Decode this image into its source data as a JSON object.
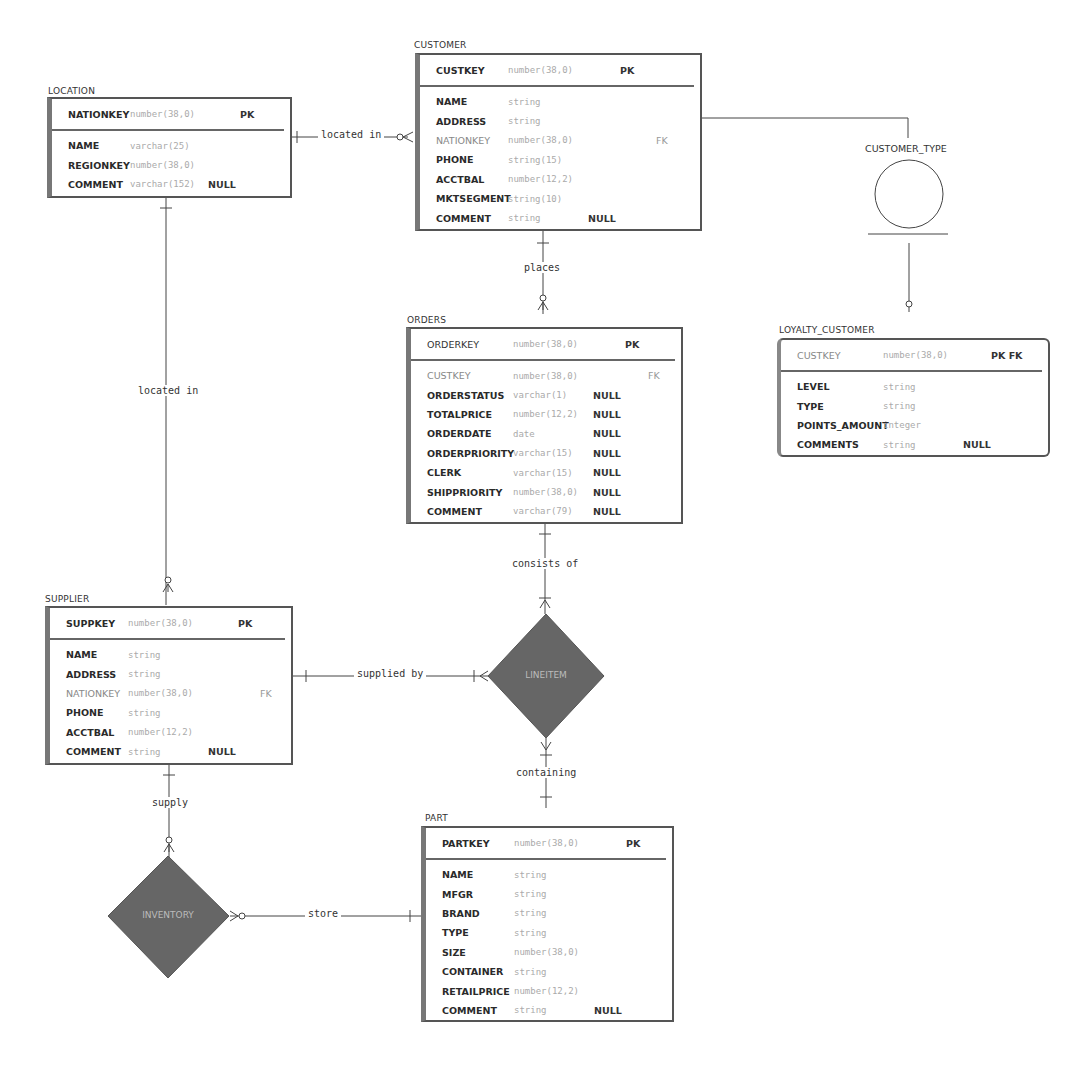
{
  "colors": {
    "entity_border": "#555555",
    "entity_left_bar": "#777777",
    "diamond_fill": "#666666",
    "line": "#444444",
    "type_text": "#aaaaaa"
  },
  "entities": {
    "location": {
      "title": "LOCATION",
      "pk": {
        "name": "NATIONKEY",
        "type": "number(38,0)",
        "key": "PK"
      },
      "attrs": [
        {
          "name": "NAME",
          "type": "varchar(25)",
          "null": "",
          "key": ""
        },
        {
          "name": "REGIONKEY",
          "type": "number(38,0)",
          "null": "",
          "key": ""
        },
        {
          "name": "COMMENT",
          "type": "varchar(152)",
          "null": "NULL",
          "key": ""
        }
      ]
    },
    "customer": {
      "title": "CUSTOMER",
      "pk": {
        "name": "CUSTKEY",
        "type": "number(38,0)",
        "key": "PK"
      },
      "attrs": [
        {
          "name": "NAME",
          "type": "string",
          "null": "",
          "key": ""
        },
        {
          "name": "ADDRESS",
          "type": "string",
          "null": "",
          "key": ""
        },
        {
          "name": "NATIONKEY",
          "type": "number(38,0)",
          "null": "",
          "key": "FK"
        },
        {
          "name": "PHONE",
          "type": "string(15)",
          "null": "",
          "key": ""
        },
        {
          "name": "ACCTBAL",
          "type": "number(12,2)",
          "null": "",
          "key": ""
        },
        {
          "name": "MKTSEGMENT",
          "type": "string(10)",
          "null": "",
          "key": ""
        },
        {
          "name": "COMMENT",
          "type": "string",
          "null": "NULL",
          "key": ""
        }
      ]
    },
    "orders": {
      "title": "ORDERS",
      "pk": {
        "name": "ORDERKEY",
        "type": "number(38,0)",
        "key": "PK"
      },
      "attrs": [
        {
          "name": "CUSTKEY",
          "type": "number(38,0)",
          "null": "",
          "key": "FK"
        },
        {
          "name": "ORDERSTATUS",
          "type": "varchar(1)",
          "null": "NULL",
          "key": ""
        },
        {
          "name": "TOTALPRICE",
          "type": "number(12,2)",
          "null": "NULL",
          "key": ""
        },
        {
          "name": "ORDERDATE",
          "type": "date",
          "null": "NULL",
          "key": ""
        },
        {
          "name": "ORDERPRIORITY",
          "type": "varchar(15)",
          "null": "NULL",
          "key": ""
        },
        {
          "name": "CLERK",
          "type": "varchar(15)",
          "null": "NULL",
          "key": ""
        },
        {
          "name": "SHIPPRIORITY",
          "type": "number(38,0)",
          "null": "NULL",
          "key": ""
        },
        {
          "name": "COMMENT",
          "type": "varchar(79)",
          "null": "NULL",
          "key": ""
        }
      ]
    },
    "loyalty_customer": {
      "title": "LOYALTY_CUSTOMER",
      "pk": {
        "name": "CUSTKEY",
        "type": "number(38,0)",
        "key": "PK FK"
      },
      "attrs": [
        {
          "name": "LEVEL",
          "type": "string",
          "null": "",
          "key": ""
        },
        {
          "name": "TYPE",
          "type": "string",
          "null": "",
          "key": ""
        },
        {
          "name": "POINTS_AMOUNT",
          "type": "integer",
          "null": "",
          "key": ""
        },
        {
          "name": "COMMENTS",
          "type": "string",
          "null": "NULL",
          "key": ""
        }
      ]
    },
    "supplier": {
      "title": "SUPPLIER",
      "pk": {
        "name": "SUPPKEY",
        "type": "number(38,0)",
        "key": "PK"
      },
      "attrs": [
        {
          "name": "NAME",
          "type": "string",
          "null": "",
          "key": ""
        },
        {
          "name": "ADDRESS",
          "type": "string",
          "null": "",
          "key": ""
        },
        {
          "name": "NATIONKEY",
          "type": "number(38,0)",
          "null": "",
          "key": "FK"
        },
        {
          "name": "PHONE",
          "type": "string",
          "null": "",
          "key": ""
        },
        {
          "name": "ACCTBAL",
          "type": "number(12,2)",
          "null": "",
          "key": ""
        },
        {
          "name": "COMMENT",
          "type": "string",
          "null": "NULL",
          "key": ""
        }
      ]
    },
    "part": {
      "title": "PART",
      "pk": {
        "name": "PARTKEY",
        "type": "number(38,0)",
        "key": "PK"
      },
      "attrs": [
        {
          "name": "NAME",
          "type": "string",
          "null": "",
          "key": ""
        },
        {
          "name": "MFGR",
          "type": "string",
          "null": "",
          "key": ""
        },
        {
          "name": "BRAND",
          "type": "string",
          "null": "",
          "key": ""
        },
        {
          "name": "TYPE",
          "type": "string",
          "null": "",
          "key": ""
        },
        {
          "name": "SIZE",
          "type": "number(38,0)",
          "null": "",
          "key": ""
        },
        {
          "name": "CONTAINER",
          "type": "string",
          "null": "",
          "key": ""
        },
        {
          "name": "RETAILPRICE",
          "type": "number(12,2)",
          "null": "",
          "key": ""
        },
        {
          "name": "COMMENT",
          "type": "string",
          "null": "NULL",
          "key": ""
        }
      ]
    }
  },
  "associative_entities": {
    "lineitem": "LINEITEM",
    "inventory": "INVENTORY"
  },
  "subtype": {
    "label": "CUSTOMER_TYPE"
  },
  "relationships": {
    "location_customer": "located in",
    "location_supplier": "located in",
    "customer_orders": "places",
    "orders_lineitem": "consists of",
    "supplier_lineitem": "supplied by",
    "lineitem_part": "containing",
    "supplier_inventory": "supply",
    "inventory_part": "store"
  }
}
